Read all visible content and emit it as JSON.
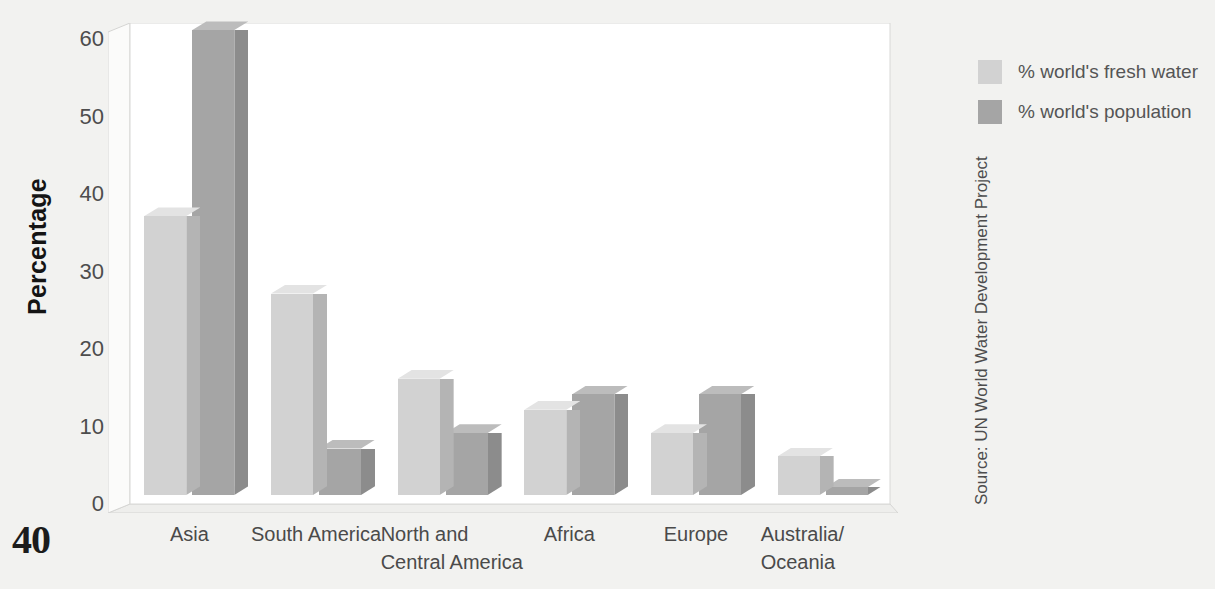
{
  "page": {
    "number": "40",
    "source_note": "Source: UN World Water Development Project"
  },
  "chart_data": {
    "type": "bar",
    "title": "",
    "xlabel": "",
    "ylabel": "Percentage",
    "ylim": [
      0,
      60
    ],
    "yticks": [
      "0",
      "10",
      "20",
      "30",
      "40",
      "50",
      "60"
    ],
    "grid": false,
    "legend_position": "right",
    "categories": [
      "Asia",
      "South America",
      "North and\nCentral America",
      "Africa",
      "Europe",
      "Australia/\nOceania"
    ],
    "category_lines": [
      [
        "Asia"
      ],
      [
        "South America"
      ],
      [
        "North and",
        "Central America"
      ],
      [
        "Africa"
      ],
      [
        "Europe"
      ],
      [
        "Australia/",
        "Oceania"
      ]
    ],
    "series": [
      {
        "name": "% world's fresh water",
        "color": "#d2d2d2",
        "side_color": "#b4b4b4",
        "top_color": "#e3e3e3",
        "values": [
          36,
          26,
          15,
          11,
          8,
          5
        ]
      },
      {
        "name": "% world's population",
        "color": "#a5a5a5",
        "side_color": "#8c8c8c",
        "top_color": "#bcbcbc",
        "values": [
          60,
          6,
          8,
          13,
          13,
          1
        ]
      }
    ]
  },
  "legend": {
    "items": [
      {
        "label": "% world's fresh water",
        "color": "#d2d2d2"
      },
      {
        "label": "% world's population",
        "color": "#a5a5a5"
      }
    ]
  }
}
